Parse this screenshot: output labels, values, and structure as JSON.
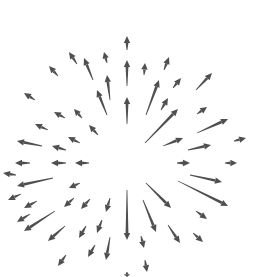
{
  "illustration": {
    "name": "radial-arrow-burst",
    "width": 257,
    "height": 277,
    "color": "#4f4f4f",
    "background": "#ffffff",
    "arrows": [
      {
        "x1": 127,
        "y1": 50,
        "x2": 127,
        "y2": 36
      },
      {
        "x1": 127,
        "y1": 86,
        "x2": 127,
        "y2": 60
      },
      {
        "x1": 127,
        "y1": 124,
        "x2": 127,
        "y2": 97
      },
      {
        "x1": 110,
        "y1": 100,
        "x2": 107,
        "y2": 75
      },
      {
        "x1": 107,
        "y1": 63,
        "x2": 104,
        "y2": 52
      },
      {
        "x1": 93,
        "y1": 80,
        "x2": 84,
        "y2": 58
      },
      {
        "x1": 77,
        "y1": 64,
        "x2": 69,
        "y2": 52
      },
      {
        "x1": 58,
        "y1": 76,
        "x2": 49,
        "y2": 66
      },
      {
        "x1": 107,
        "y1": 115,
        "x2": 97,
        "y2": 90
      },
      {
        "x1": 82,
        "y1": 118,
        "x2": 74,
        "y2": 109
      },
      {
        "x1": 98,
        "y1": 135,
        "x2": 89,
        "y2": 125
      },
      {
        "x1": 65,
        "y1": 118,
        "x2": 54,
        "y2": 112
      },
      {
        "x1": 35,
        "y1": 100,
        "x2": 24,
        "y2": 93
      },
      {
        "x1": 48,
        "y1": 130,
        "x2": 35,
        "y2": 124
      },
      {
        "x1": 80,
        "y1": 143,
        "x2": 68,
        "y2": 137
      },
      {
        "x1": 42,
        "y1": 146,
        "x2": 17,
        "y2": 141
      },
      {
        "x1": 66,
        "y1": 150,
        "x2": 52,
        "y2": 146
      },
      {
        "x1": 30,
        "y1": 163,
        "x2": 15,
        "y2": 163
      },
      {
        "x1": 66,
        "y1": 163,
        "x2": 51,
        "y2": 163
      },
      {
        "x1": 89,
        "y1": 163,
        "x2": 75,
        "y2": 163
      },
      {
        "x1": 16,
        "y1": 175,
        "x2": 3,
        "y2": 173
      },
      {
        "x1": 53,
        "y1": 178,
        "x2": 17,
        "y2": 186
      },
      {
        "x1": 80,
        "y1": 183,
        "x2": 69,
        "y2": 188
      },
      {
        "x1": 21,
        "y1": 194,
        "x2": 8,
        "y2": 200
      },
      {
        "x1": 37,
        "y1": 201,
        "x2": 24,
        "y2": 208
      },
      {
        "x1": 74,
        "y1": 198,
        "x2": 64,
        "y2": 207
      },
      {
        "x1": 90,
        "y1": 199,
        "x2": 81,
        "y2": 209
      },
      {
        "x1": 110,
        "y1": 198,
        "x2": 106,
        "y2": 212
      },
      {
        "x1": 30,
        "y1": 214,
        "x2": 17,
        "y2": 222
      },
      {
        "x1": 55,
        "y1": 211,
        "x2": 24,
        "y2": 231
      },
      {
        "x1": 65,
        "y1": 226,
        "x2": 48,
        "y2": 241
      },
      {
        "x1": 86,
        "y1": 226,
        "x2": 79,
        "y2": 238
      },
      {
        "x1": 102,
        "y1": 220,
        "x2": 97,
        "y2": 233
      },
      {
        "x1": 95,
        "y1": 245,
        "x2": 88,
        "y2": 257
      },
      {
        "x1": 110,
        "y1": 237,
        "x2": 106,
        "y2": 260
      },
      {
        "x1": 66,
        "y1": 255,
        "x2": 58,
        "y2": 266
      },
      {
        "x1": 127,
        "y1": 190,
        "x2": 127,
        "y2": 240
      },
      {
        "x1": 141,
        "y1": 236,
        "x2": 144,
        "y2": 248
      },
      {
        "x1": 145,
        "y1": 260,
        "x2": 147,
        "y2": 272
      },
      {
        "x1": 127,
        "y1": 272,
        "x2": 127,
        "y2": 277
      },
      {
        "x1": 143,
        "y1": 200,
        "x2": 156,
        "y2": 232
      },
      {
        "x1": 146,
        "y1": 183,
        "x2": 171,
        "y2": 208
      },
      {
        "x1": 168,
        "y1": 225,
        "x2": 180,
        "y2": 243
      },
      {
        "x1": 178,
        "y1": 181,
        "x2": 228,
        "y2": 206
      },
      {
        "x1": 190,
        "y1": 175,
        "x2": 222,
        "y2": 182
      },
      {
        "x1": 196,
        "y1": 211,
        "x2": 207,
        "y2": 219
      },
      {
        "x1": 193,
        "y1": 233,
        "x2": 203,
        "y2": 242
      },
      {
        "x1": 177,
        "y1": 163,
        "x2": 190,
        "y2": 163
      },
      {
        "x1": 225,
        "y1": 163,
        "x2": 237,
        "y2": 163
      },
      {
        "x1": 234,
        "y1": 141,
        "x2": 246,
        "y2": 138
      },
      {
        "x1": 188,
        "y1": 150,
        "x2": 211,
        "y2": 145
      },
      {
        "x1": 163,
        "y1": 146,
        "x2": 183,
        "y2": 138
      },
      {
        "x1": 197,
        "y1": 133,
        "x2": 228,
        "y2": 119
      },
      {
        "x1": 145,
        "y1": 143,
        "x2": 178,
        "y2": 109
      },
      {
        "x1": 197,
        "y1": 114,
        "x2": 207,
        "y2": 107
      },
      {
        "x1": 161,
        "y1": 110,
        "x2": 168,
        "y2": 98
      },
      {
        "x1": 146,
        "y1": 115,
        "x2": 159,
        "y2": 80
      },
      {
        "x1": 173,
        "y1": 88,
        "x2": 181,
        "y2": 78
      },
      {
        "x1": 196,
        "y1": 90,
        "x2": 212,
        "y2": 73
      },
      {
        "x1": 164,
        "y1": 70,
        "x2": 169,
        "y2": 57
      },
      {
        "x1": 144,
        "y1": 75,
        "x2": 145,
        "y2": 63
      }
    ]
  }
}
